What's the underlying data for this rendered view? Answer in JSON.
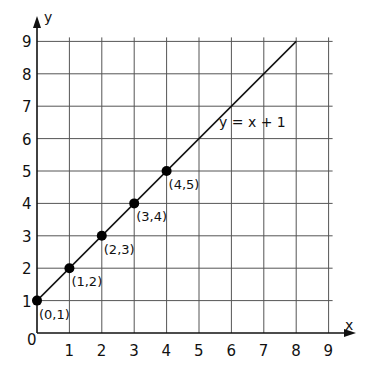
{
  "chart_data": {
    "type": "line",
    "title": "",
    "xlabel": "x",
    "ylabel": "y",
    "xlim": [
      0,
      9
    ],
    "ylim": [
      0,
      9
    ],
    "grid": true,
    "x_ticks": [
      "0",
      "1",
      "2",
      "3",
      "4",
      "5",
      "6",
      "7",
      "8",
      "9"
    ],
    "y_ticks": [
      "1",
      "2",
      "3",
      "4",
      "5",
      "6",
      "7",
      "8",
      "9"
    ],
    "series": [
      {
        "name": "y = x + 1",
        "line": {
          "x": [
            0,
            8
          ],
          "y": [
            1,
            9
          ]
        },
        "points": [
          {
            "x": 0,
            "y": 1,
            "label": "(0,1)"
          },
          {
            "x": 1,
            "y": 2,
            "label": "(1,2)"
          },
          {
            "x": 2,
            "y": 3,
            "label": "(2,3)"
          },
          {
            "x": 3,
            "y": 4,
            "label": "(3,4)"
          },
          {
            "x": 4,
            "y": 5,
            "label": "(4,5)"
          }
        ]
      }
    ],
    "annotations": [
      {
        "text": "y = x + 1",
        "x": 5.6,
        "y": 6.6
      }
    ]
  },
  "labels": {
    "x_axis": "x",
    "y_axis": "y",
    "origin": "0",
    "equation": "y = x + 1"
  },
  "colors": {
    "axis": "#111111",
    "grid": "#555555",
    "line": "#111111",
    "point": "#000000"
  }
}
